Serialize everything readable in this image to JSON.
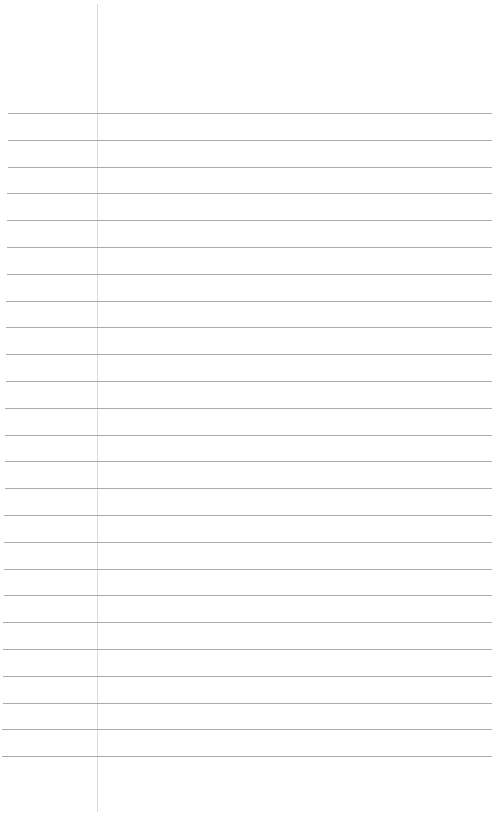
{
  "page": {
    "type": "blank-lined-paper",
    "background_color": "#ffffff",
    "rule_color": "#9c9c9c",
    "margin_line_color": "#dadada",
    "margin_line_x": 97,
    "rules": {
      "count": 25,
      "first_y": 113,
      "spacing": 26.8,
      "left_x_top": 8,
      "left_x_bottom": 2,
      "right_x": 492
    }
  }
}
